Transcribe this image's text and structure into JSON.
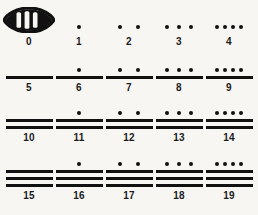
{
  "figure": {
    "background_color": "#f7f6f3",
    "ink_color": "#111111"
  },
  "symbols": {
    "zero": "shell-glyph",
    "one": "dot",
    "five": "bar"
  },
  "chart_data": {
    "type": "table",
    "columns": 5,
    "rows": 4,
    "entries": [
      {
        "value": 0,
        "label": "0",
        "dots": 0,
        "bars": 0,
        "shell": true
      },
      {
        "value": 1,
        "label": "1",
        "dots": 1,
        "bars": 0,
        "shell": false
      },
      {
        "value": 2,
        "label": "2",
        "dots": 2,
        "bars": 0,
        "shell": false
      },
      {
        "value": 3,
        "label": "3",
        "dots": 3,
        "bars": 0,
        "shell": false
      },
      {
        "value": 4,
        "label": "4",
        "dots": 4,
        "bars": 0,
        "shell": false
      },
      {
        "value": 5,
        "label": "5",
        "dots": 0,
        "bars": 1,
        "shell": false
      },
      {
        "value": 6,
        "label": "6",
        "dots": 1,
        "bars": 1,
        "shell": false
      },
      {
        "value": 7,
        "label": "7",
        "dots": 2,
        "bars": 1,
        "shell": false
      },
      {
        "value": 8,
        "label": "8",
        "dots": 3,
        "bars": 1,
        "shell": false
      },
      {
        "value": 9,
        "label": "9",
        "dots": 4,
        "bars": 1,
        "shell": false
      },
      {
        "value": 10,
        "label": "10",
        "dots": 0,
        "bars": 2,
        "shell": false
      },
      {
        "value": 11,
        "label": "11",
        "dots": 1,
        "bars": 2,
        "shell": false
      },
      {
        "value": 12,
        "label": "12",
        "dots": 2,
        "bars": 2,
        "shell": false
      },
      {
        "value": 13,
        "label": "13",
        "dots": 3,
        "bars": 2,
        "shell": false
      },
      {
        "value": 14,
        "label": "14",
        "dots": 4,
        "bars": 2,
        "shell": false
      },
      {
        "value": 15,
        "label": "15",
        "dots": 0,
        "bars": 3,
        "shell": false
      },
      {
        "value": 16,
        "label": "16",
        "dots": 1,
        "bars": 3,
        "shell": false
      },
      {
        "value": 17,
        "label": "17",
        "dots": 2,
        "bars": 3,
        "shell": false
      },
      {
        "value": 18,
        "label": "18",
        "dots": 3,
        "bars": 3,
        "shell": false
      },
      {
        "value": 19,
        "label": "19",
        "dots": 4,
        "bars": 3,
        "shell": false
      }
    ]
  }
}
